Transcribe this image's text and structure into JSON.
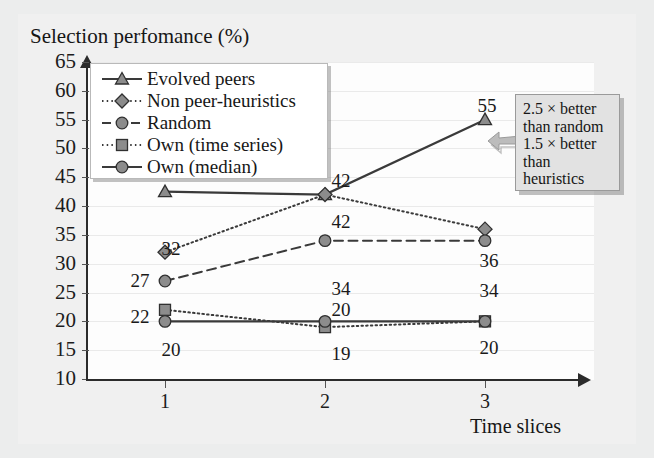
{
  "chart_data": {
    "type": "line",
    "title": "Selection perfomance (%)",
    "xlabel": "Time slices",
    "ylabel": "Selection perfomance (%)",
    "x": [
      1,
      2,
      3
    ],
    "xticklabels": [
      "1",
      "2",
      "3"
    ],
    "ylim": [
      10,
      65
    ],
    "yticks": [
      10,
      15,
      20,
      25,
      30,
      35,
      40,
      45,
      50,
      55,
      60,
      65
    ],
    "yticklabels": [
      "10",
      "15",
      "20",
      "25",
      "30",
      "35",
      "40",
      "45",
      "50",
      "55",
      "60",
      "65"
    ],
    "grid": true,
    "legend_position": "top-left",
    "series": [
      {
        "name": "Evolved peers",
        "marker": "triangle",
        "linestyle": "solid",
        "values": [
          42.5,
          42,
          55
        ],
        "point_labels": [
          "",
          "42",
          "55"
        ]
      },
      {
        "name": "Non peer-heuristics",
        "marker": "diamond",
        "linestyle": "dotted",
        "values": [
          32,
          42,
          36
        ],
        "point_labels": [
          "32",
          "42",
          "36"
        ]
      },
      {
        "name": "Random",
        "marker": "circle",
        "linestyle": "dashed",
        "values": [
          27,
          34,
          34
        ],
        "point_labels": [
          "27",
          "34",
          "34"
        ]
      },
      {
        "name": "Own (time series)",
        "marker": "square",
        "linestyle": "dotted",
        "values": [
          22,
          19,
          20
        ],
        "point_labels": [
          "22",
          "19",
          "20"
        ]
      },
      {
        "name": "Own (median)",
        "marker": "circle",
        "linestyle": "solid",
        "values": [
          20,
          20,
          20
        ],
        "point_labels": [
          "20",
          "20",
          ""
        ]
      }
    ],
    "annotations": [
      {
        "name": "comparison-callout",
        "lines": [
          "2.5 × better",
          "than random",
          "1.5 × better",
          "than",
          "heuristics"
        ],
        "arrow": "left"
      }
    ],
    "colors": {
      "series_line": "#3a3a3a",
      "marker_fill": "#8c8c8c",
      "axis": "#2b2b2b",
      "grid": "#eaeaea",
      "plot_background": "#fdfdfd",
      "page_background": "#eceded",
      "callout_background": "#e2e2e2",
      "legend_background": "#ffffff"
    }
  },
  "point_label_positions": {
    "s0": [
      {
        "v": "",
        "x": 0,
        "y": 0
      },
      {
        "v": "42",
        "x": 318,
        "y": 171
      },
      {
        "v": "55",
        "x": 464,
        "y": 96
      }
    ],
    "s1": [
      {
        "v": "32",
        "x": 148,
        "y": 239
      },
      {
        "v": "42",
        "x": 318,
        "y": 212
      },
      {
        "v": "36",
        "x": 466,
        "y": 251
      }
    ],
    "s2": [
      {
        "v": "27",
        "x": 117,
        "y": 271
      },
      {
        "v": "34",
        "x": 318,
        "y": 279
      },
      {
        "v": "34",
        "x": 466,
        "y": 281
      }
    ],
    "s3": [
      {
        "v": "22",
        "x": 117,
        "y": 307
      },
      {
        "v": "19",
        "x": 318,
        "y": 344
      },
      {
        "v": "20",
        "x": 466,
        "y": 338
      }
    ],
    "s4": [
      {
        "v": "20",
        "x": 148,
        "y": 340
      },
      {
        "v": "20",
        "x": 318,
        "y": 300
      },
      {
        "v": "",
        "x": 0,
        "y": 0
      }
    ]
  }
}
